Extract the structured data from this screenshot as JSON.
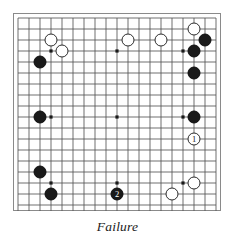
{
  "diagram": {
    "caption": "Failure",
    "kind": "go-board-problem-diagram",
    "board": {
      "size": 19,
      "line_color": "#555555",
      "edge_color": "#8a8a8a",
      "background": "#ffffff",
      "star_points": [
        {
          "col": 4,
          "row": 4
        },
        {
          "col": 10,
          "row": 4
        },
        {
          "col": 16,
          "row": 4
        },
        {
          "col": 4,
          "row": 10
        },
        {
          "col": 10,
          "row": 10
        },
        {
          "col": 16,
          "row": 10
        },
        {
          "col": 4,
          "row": 16
        },
        {
          "col": 10,
          "row": 16
        },
        {
          "col": 16,
          "row": 16
        }
      ]
    },
    "colors": {
      "black_stone": "#1a1a1a",
      "white_stone": "#ffffff",
      "stone_outline": "#2b2b2b",
      "caption_text": "#1a1a1a"
    },
    "stones": [
      {
        "color": "white",
        "col": 4,
        "row": 3,
        "label": ""
      },
      {
        "color": "white",
        "col": 5,
        "row": 4,
        "label": ""
      },
      {
        "color": "white",
        "col": 11,
        "row": 3,
        "label": ""
      },
      {
        "color": "white",
        "col": 14,
        "row": 3,
        "label": ""
      },
      {
        "color": "white",
        "col": 17,
        "row": 2,
        "label": ""
      },
      {
        "color": "white",
        "col": 17,
        "row": 12,
        "label": "1"
      },
      {
        "color": "white",
        "col": 17,
        "row": 16,
        "label": ""
      },
      {
        "color": "white",
        "col": 15,
        "row": 17,
        "label": ""
      },
      {
        "color": "black",
        "col": 3,
        "row": 5,
        "label": ""
      },
      {
        "color": "black",
        "col": 3,
        "row": 10,
        "label": ""
      },
      {
        "color": "black",
        "col": 3,
        "row": 15,
        "label": ""
      },
      {
        "color": "black",
        "col": 4,
        "row": 17,
        "label": ""
      },
      {
        "color": "black",
        "col": 10,
        "row": 17,
        "label": "2"
      },
      {
        "color": "black",
        "col": 18,
        "row": 3,
        "label": ""
      },
      {
        "color": "black",
        "col": 17,
        "row": 4,
        "label": ""
      },
      {
        "color": "black",
        "col": 17,
        "row": 6,
        "label": ""
      },
      {
        "color": "black",
        "col": 17,
        "row": 10,
        "label": ""
      }
    ]
  }
}
